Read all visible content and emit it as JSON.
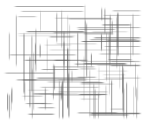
{
  "image": {
    "description": "Crosshatch texture of blurred gray horizontal and vertical strokes on white",
    "background_color": "#ffffff",
    "stroke_color": "#5a5a5a"
  }
}
